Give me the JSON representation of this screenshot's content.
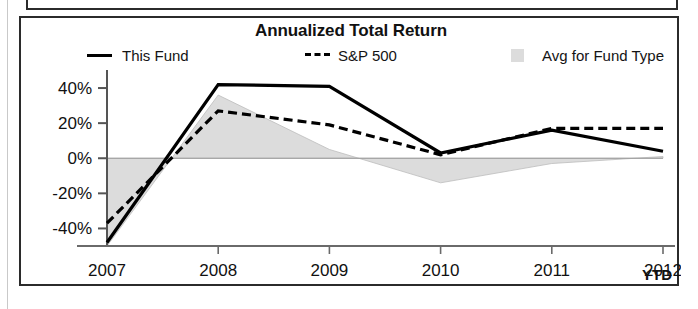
{
  "chart_data": {
    "type": "line",
    "title": "Annualized Total Return",
    "xlabel": "",
    "ylabel": "",
    "categories": [
      "2007",
      "2008",
      "2009",
      "2010",
      "2011",
      "2012"
    ],
    "x_tick_labels": [
      "2007",
      "2008",
      "2009",
      "2010",
      "2011",
      "2012"
    ],
    "x_axis_suffix": "YTD",
    "y_tick_labels": [
      "40%",
      "20%",
      "0%",
      "-20%",
      "-40%"
    ],
    "y_ticks": [
      40,
      20,
      0,
      -20,
      -40
    ],
    "ylim": [
      -50,
      48
    ],
    "grid": false,
    "zero_line": true,
    "legend_position": "top",
    "series": [
      {
        "name": "This Fund",
        "style": "solid",
        "color": "#000000",
        "values": [
          -48,
          42,
          41,
          3,
          16,
          4
        ]
      },
      {
        "name": "S&P 500",
        "style": "dashed",
        "color": "#000000",
        "values": [
          -37,
          27,
          19,
          2,
          17,
          17
        ]
      },
      {
        "name": "Avg for Fund Type",
        "style": "area",
        "color": "#dcdcdc",
        "values": [
          -50,
          36,
          5,
          -14,
          -3,
          1
        ]
      }
    ]
  },
  "chart": {
    "title": "Annualized Total Return",
    "ytd_label": "YTD"
  },
  "legend": {
    "items": [
      {
        "label": "This Fund",
        "marker": "solid-line-swatch"
      },
      {
        "label": "S&P 500",
        "marker": "dashed-line-swatch"
      },
      {
        "label": "Avg for Fund Type",
        "marker": "gray-area-swatch"
      }
    ]
  },
  "axes": {
    "y_labels": [
      "40%",
      "20%",
      "0%",
      "-20%",
      "-40%"
    ],
    "x_labels": [
      "2007",
      "2008",
      "2009",
      "2010",
      "2011",
      "2012"
    ]
  },
  "colors": {
    "line": "#000000",
    "area_fill": "#dcdcdc",
    "frame": "#2b2b2b",
    "axis": "#555555",
    "background": "#ffffff"
  }
}
